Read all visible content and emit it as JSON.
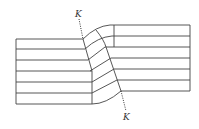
{
  "diagram": {
    "type": "kink-band-layers",
    "labels": {
      "top": "K",
      "bottom": "K"
    },
    "colors": {
      "line": "#444444",
      "background": "#ffffff"
    },
    "left_block": {
      "x0": 16,
      "x1": 92,
      "layer_lines_y": [
        39,
        49,
        60,
        71,
        82,
        93,
        104
      ]
    },
    "right_block": {
      "x0": 114,
      "x1": 190,
      "layer_lines_y": [
        25,
        36,
        47,
        58,
        69,
        80,
        91
      ]
    },
    "layer_count": 6
  }
}
